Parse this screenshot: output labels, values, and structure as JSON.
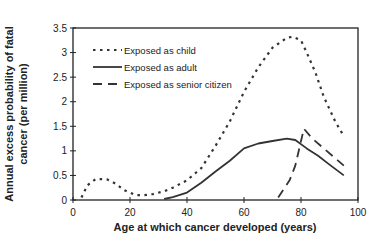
{
  "chart_data": {
    "type": "line",
    "title": "",
    "xlabel": "Age at which cancer developed (years)",
    "ylabel": "Annual excess probability of fatal cancer (per million)",
    "xlim": [
      0,
      100
    ],
    "ylim": [
      0,
      3.5
    ],
    "xticks": [
      0,
      20,
      40,
      60,
      80,
      100
    ],
    "yticks": [
      0,
      0.5,
      1,
      1.5,
      2,
      2.5,
      3,
      3.5
    ],
    "grid": false,
    "legend_position": "upper left",
    "series": [
      {
        "name": "Exposed as child",
        "style": "dotted",
        "x": [
          3,
          5,
          8,
          12,
          15,
          18,
          22,
          25,
          28,
          32,
          35,
          40,
          45,
          50,
          55,
          60,
          65,
          70,
          75,
          77,
          80,
          82,
          85,
          88,
          92,
          95
        ],
        "y": [
          0.05,
          0.3,
          0.43,
          0.42,
          0.33,
          0.2,
          0.1,
          0.1,
          0.12,
          0.18,
          0.25,
          0.4,
          0.65,
          1.1,
          1.6,
          2.2,
          2.7,
          3.1,
          3.3,
          3.32,
          3.25,
          3.0,
          2.6,
          2.1,
          1.6,
          1.3
        ]
      },
      {
        "name": "Exposed as adult",
        "style": "solid",
        "x": [
          32,
          35,
          40,
          45,
          50,
          55,
          60,
          65,
          70,
          75,
          78,
          82,
          86,
          90,
          95
        ],
        "y": [
          0.02,
          0.06,
          0.15,
          0.35,
          0.58,
          0.8,
          1.05,
          1.15,
          1.2,
          1.25,
          1.22,
          1.05,
          0.9,
          0.72,
          0.5
        ]
      },
      {
        "name": "Exposed as senior citizen",
        "style": "dashed",
        "x": [
          72,
          76,
          78,
          80,
          81,
          84,
          88,
          92,
          95
        ],
        "y": [
          0.05,
          0.4,
          0.7,
          1.2,
          1.45,
          1.25,
          1.05,
          0.85,
          0.7
        ]
      }
    ]
  }
}
